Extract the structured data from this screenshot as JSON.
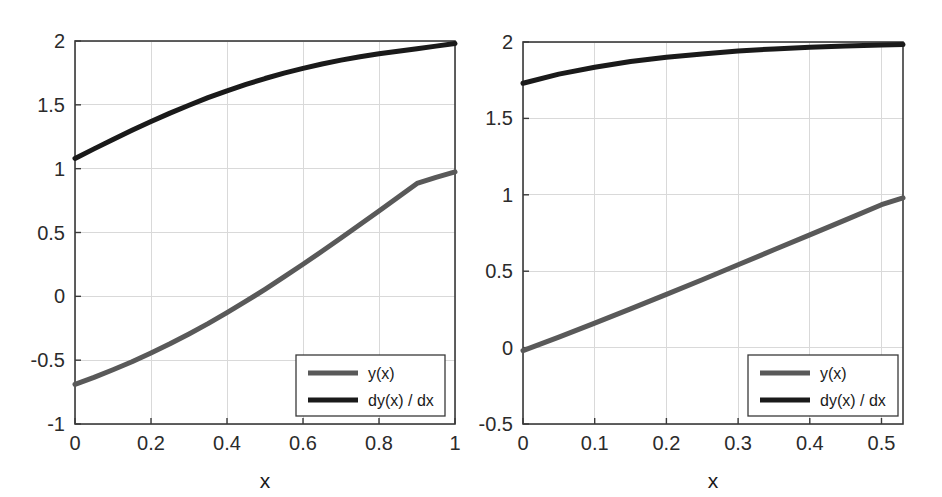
{
  "figure": {
    "background_color": "#ffffff",
    "grid_color": "#d9d9d9",
    "axis_color": "#3a3a3a"
  },
  "chart_data": [
    {
      "type": "line",
      "panel": "left",
      "title": "",
      "xlabel": "x",
      "ylabel": "",
      "xlim": [
        0,
        1
      ],
      "ylim": [
        -1,
        2
      ],
      "xticks": [
        0,
        0.2,
        0.4,
        0.6,
        0.8,
        1
      ],
      "xticklabels": [
        "0",
        "0.2",
        "0.4",
        "0.6",
        "0.8",
        "1"
      ],
      "yticks": [
        -1,
        -0.5,
        0,
        0.5,
        1,
        1.5,
        2
      ],
      "yticklabels": [
        "-1",
        "-0.5",
        "0",
        "0.5",
        "1",
        "1.5",
        "2"
      ],
      "grid": true,
      "legend_position": "lower right",
      "series": [
        {
          "name": "y(x)",
          "color": "#595959",
          "linewidth": 5,
          "x": [
            0,
            0.05,
            0.1,
            0.15,
            0.2,
            0.25,
            0.3,
            0.35,
            0.4,
            0.45,
            0.5,
            0.55,
            0.6,
            0.65,
            0.7,
            0.75,
            0.8,
            0.85,
            0.9,
            0.95,
            1
          ],
          "values": [
            -0.69,
            -0.635,
            -0.575,
            -0.512,
            -0.444,
            -0.372,
            -0.295,
            -0.214,
            -0.128,
            -0.038,
            0.055,
            0.152,
            0.251,
            0.353,
            0.457,
            0.562,
            0.669,
            0.776,
            0.884,
            0.932,
            0.975
          ]
        },
        {
          "name": "dy(x) / dx",
          "color": "#1a1a1a",
          "linewidth": 5,
          "x": [
            0,
            0.05,
            0.1,
            0.15,
            0.2,
            0.25,
            0.3,
            0.35,
            0.4,
            0.45,
            0.5,
            0.55,
            0.6,
            0.65,
            0.7,
            0.75,
            0.8,
            0.85,
            0.9,
            0.95,
            1
          ],
          "values": [
            1.08,
            1.155,
            1.228,
            1.3,
            1.369,
            1.435,
            1.497,
            1.556,
            1.61,
            1.66,
            1.706,
            1.748,
            1.786,
            1.82,
            1.85,
            1.877,
            1.9,
            1.92,
            1.94,
            1.96,
            1.98
          ]
        }
      ]
    },
    {
      "type": "line",
      "panel": "right",
      "title": "",
      "xlabel": "x",
      "ylabel": "",
      "xlim": [
        0,
        0.53
      ],
      "ylim": [
        -0.5,
        2
      ],
      "xticks": [
        0,
        0.1,
        0.2,
        0.3,
        0.4,
        0.5
      ],
      "xticklabels": [
        "0",
        "0.1",
        "0.2",
        "0.3",
        "0.4",
        "0.5"
      ],
      "yticks": [
        -0.5,
        0,
        0.5,
        1,
        1.5,
        2
      ],
      "yticklabels": [
        "-0.5",
        "0",
        "0.5",
        "1",
        "1.5",
        "2"
      ],
      "grid": true,
      "legend_position": "lower right",
      "series": [
        {
          "name": "y(x)",
          "color": "#595959",
          "linewidth": 5,
          "x": [
            0,
            0.05,
            0.1,
            0.15,
            0.2,
            0.25,
            0.3,
            0.35,
            0.4,
            0.45,
            0.5,
            0.53
          ],
          "values": [
            -0.02,
            0.068,
            0.16,
            0.253,
            0.348,
            0.444,
            0.542,
            0.64,
            0.738,
            0.836,
            0.935,
            0.98
          ]
        },
        {
          "name": "dy(x) / dx",
          "color": "#1a1a1a",
          "linewidth": 5,
          "x": [
            0,
            0.05,
            0.1,
            0.15,
            0.2,
            0.25,
            0.3,
            0.35,
            0.4,
            0.45,
            0.5,
            0.53
          ],
          "values": [
            1.73,
            1.79,
            1.835,
            1.872,
            1.9,
            1.922,
            1.941,
            1.955,
            1.966,
            1.974,
            1.98,
            1.983
          ]
        }
      ]
    }
  ],
  "legend": {
    "entries": [
      {
        "label": "y(x)",
        "color": "#595959"
      },
      {
        "label": "dy(x) / dx",
        "color": "#1a1a1a"
      }
    ]
  }
}
